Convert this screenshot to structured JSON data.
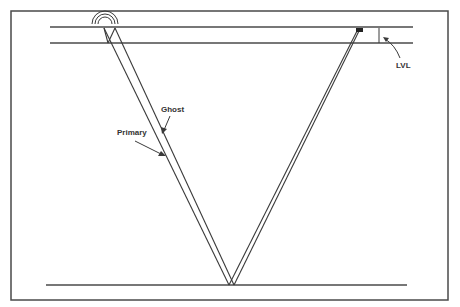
{
  "diagram": {
    "type": "seismic-ray-path",
    "labels": {
      "ghost": "Ghost",
      "primary": "Primary",
      "lvl": "LVL"
    },
    "elements": {
      "source": "source-wave-icon",
      "receiver": "receiver-box",
      "surface": "surface-line",
      "lvl_base": "low-velocity-layer-base-line",
      "reflector": "reflector-line"
    },
    "colors": {
      "line": "#3a3a3a",
      "background": "#ffffff",
      "text": "#333333"
    }
  }
}
